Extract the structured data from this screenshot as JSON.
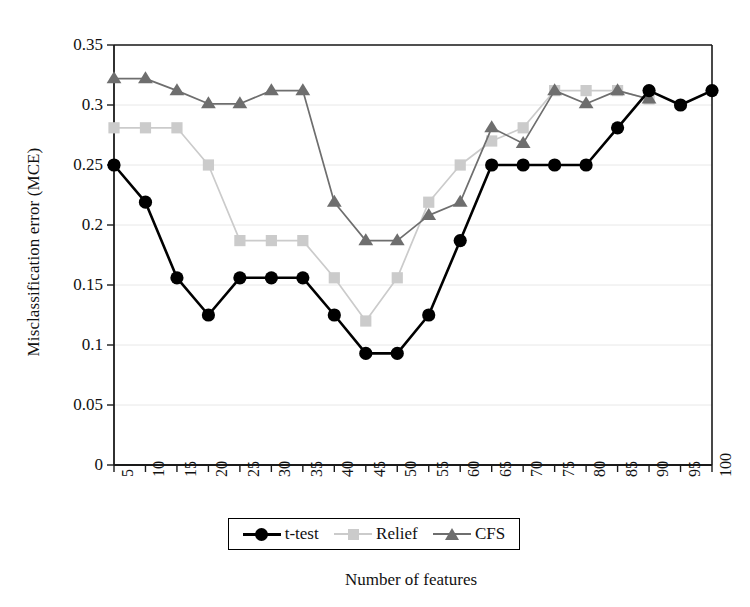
{
  "chart_data": {
    "type": "line",
    "title": "",
    "xlabel": "Number of features",
    "ylabel": "Misclassification error (MCE)",
    "x": [
      5,
      10,
      15,
      20,
      25,
      30,
      35,
      40,
      45,
      50,
      55,
      60,
      65,
      70,
      75,
      80,
      85,
      90,
      95,
      100
    ],
    "xtick_labels": [
      "5",
      "10",
      "15",
      "20",
      "25",
      "30",
      "35",
      "40",
      "45",
      "50",
      "55",
      "60",
      "65",
      "70",
      "75",
      "80",
      "85",
      "90",
      "95",
      "100"
    ],
    "ytick_labels": [
      "0",
      "0.05",
      "0.1",
      "0.15",
      "0.2",
      "0.25",
      "0.3",
      "0.35"
    ],
    "ytick_values": [
      0,
      0.05,
      0.1,
      0.15,
      0.2,
      0.25,
      0.3,
      0.35
    ],
    "xlim": [
      5,
      100
    ],
    "ylim": [
      0,
      0.35
    ],
    "grid": "horizontal",
    "legend_position": "below-axes",
    "series": [
      {
        "name": "t-test",
        "color": "#000000",
        "marker": "circle",
        "x": [
          5,
          10,
          15,
          20,
          25,
          30,
          35,
          40,
          45,
          50,
          55,
          60,
          65,
          70,
          75,
          80,
          85,
          90,
          95,
          100
        ],
        "values": [
          0.25,
          0.219,
          0.156,
          0.125,
          0.156,
          0.156,
          0.156,
          0.125,
          0.093,
          0.093,
          0.125,
          0.187,
          0.25,
          0.25,
          0.25,
          0.25,
          0.281,
          0.312,
          0.3,
          0.312
        ]
      },
      {
        "name": "Relief",
        "color": "#cbcbcb",
        "marker": "square",
        "x": [
          5,
          10,
          15,
          20,
          25,
          30,
          35,
          40,
          45,
          50,
          55,
          60,
          65,
          70,
          75,
          80,
          85,
          90
        ],
        "values": [
          0.281,
          0.281,
          0.281,
          0.25,
          0.187,
          0.187,
          0.187,
          0.156,
          0.12,
          0.156,
          0.219,
          0.25,
          0.27,
          0.281,
          0.312,
          0.312,
          0.312,
          0.305
        ]
      },
      {
        "name": "CFS",
        "color": "#6e6e6e",
        "marker": "triangle",
        "x": [
          5,
          10,
          15,
          20,
          25,
          30,
          35,
          40,
          45,
          50,
          55,
          60,
          65,
          70,
          75,
          80,
          85,
          90
        ],
        "values": [
          0.322,
          0.322,
          0.312,
          0.301,
          0.301,
          0.312,
          0.312,
          0.219,
          0.187,
          0.187,
          0.208,
          0.219,
          0.281,
          0.268,
          0.312,
          0.301,
          0.312,
          0.305
        ]
      }
    ]
  },
  "legend": {
    "items": [
      {
        "label": "t-test"
      },
      {
        "label": "Relief"
      },
      {
        "label": "CFS"
      }
    ]
  },
  "colors": {
    "ttest": "#000000",
    "relief": "#cbcbcb",
    "cfs": "#6e6e6e",
    "axis": "#1a1a1a",
    "grid": "#e8e8e8",
    "background": "#ffffff"
  }
}
